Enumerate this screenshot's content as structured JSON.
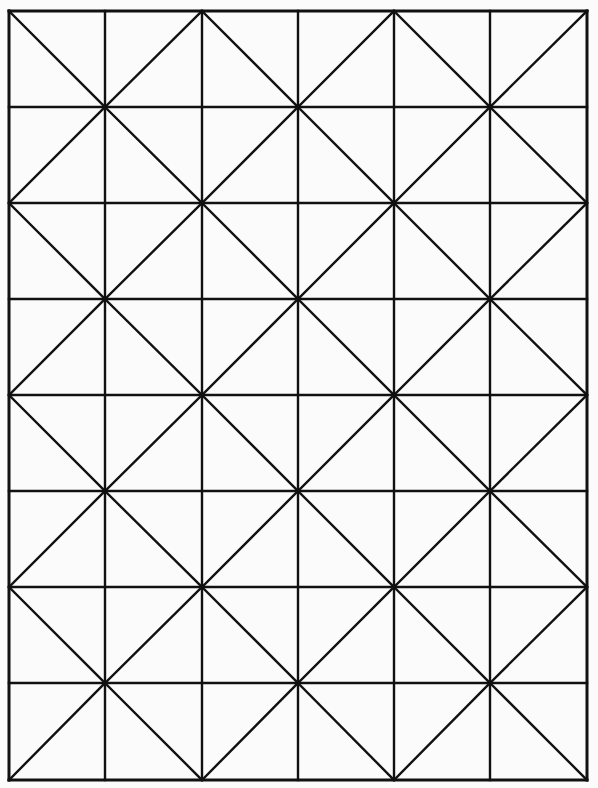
{
  "figure": {
    "columns": 6,
    "rows": 8,
    "x_lines": [
      9,
      105,
      202,
      298,
      394,
      490,
      587
    ],
    "y_lines": [
      11,
      107,
      203,
      299,
      395,
      491,
      587,
      683,
      780
    ],
    "diagonal_rule": "cell (col,row): backslash if (col+row) even, slash if odd",
    "line_color": "#111111",
    "background_color": "#fbfbfb",
    "grid_stroke_width": 2.4,
    "diagonal_stroke_width": 2.4
  }
}
